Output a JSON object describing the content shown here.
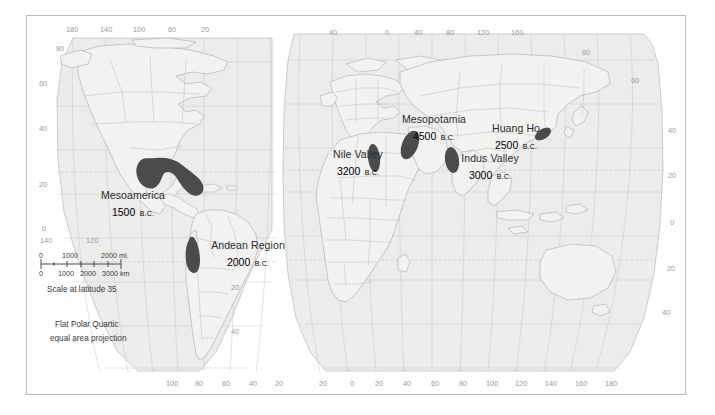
{
  "map": {
    "title": "World map of early civilizations",
    "projection_note_line1": "Flat Polar Quartic",
    "projection_note_line2": "equal area projection",
    "scale_caption": "Scale at latitude 35",
    "colors": {
      "land": "#ececeb",
      "ocean": "#ffffff",
      "graticule": "#c9c9cb",
      "tropic_line": "#c4b9c4",
      "coastline": "#a9a9ab",
      "civilization_fill": "#4b4b4d",
      "border_frame": "#b9b9bb",
      "tick_text": "#9a9a9c",
      "label_text": "#2b2b2b"
    }
  },
  "scalebar": {
    "miles_ticks": [
      "0",
      "1000",
      "2000 mi."
    ],
    "km_ticks": [
      "0",
      "1000",
      "2000",
      "3000 km"
    ]
  },
  "civilizations": [
    {
      "name": "Mesoamerica",
      "date": "1500",
      "era": "B.C."
    },
    {
      "name": "Andean Region",
      "date": "2000",
      "era": "B.C."
    },
    {
      "name": "Nile Valley",
      "date": "3200",
      "era": "B.C."
    },
    {
      "name": "Mesopotamia",
      "date": "4500",
      "era": "B.C."
    },
    {
      "name": "Indus Valley",
      "date": "3000",
      "era": "B.C."
    },
    {
      "name": "Huang Ho",
      "date": "2500",
      "era": "B.C."
    }
  ],
  "graticule": {
    "top_west": [
      "180",
      "140",
      "100",
      "60",
      "20"
    ],
    "top_east": [
      "40",
      "0",
      "40",
      "80",
      "120",
      "160"
    ],
    "bottom_west": [
      "100",
      "80",
      "60",
      "40",
      "20"
    ],
    "bottom_east": [
      "20",
      "0",
      "20",
      "40",
      "60",
      "80",
      "100",
      "120",
      "140",
      "160",
      "180"
    ],
    "left_lat": [
      "80",
      "60",
      "40",
      "20",
      "0"
    ],
    "left_bottom_lon": [
      "140",
      "120"
    ],
    "mid_lat": [
      "20",
      "40"
    ],
    "right_lat_top": [
      "80",
      "60"
    ],
    "right_lat": [
      "40",
      "20",
      "0",
      "20",
      "40"
    ]
  }
}
